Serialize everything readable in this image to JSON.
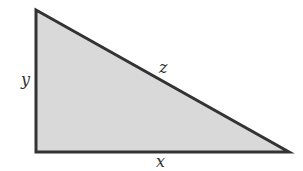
{
  "diagram": {
    "type": "right-triangle",
    "vertices": {
      "top": [
        36,
        10
      ],
      "right_angle": [
        36,
        152
      ],
      "right": [
        289,
        152
      ]
    },
    "fill_color": "#d9d9d9",
    "stroke_color": "#333333",
    "labels": {
      "vertical_leg": "y",
      "hypotenuse": "z",
      "horizontal_leg": "x"
    }
  }
}
